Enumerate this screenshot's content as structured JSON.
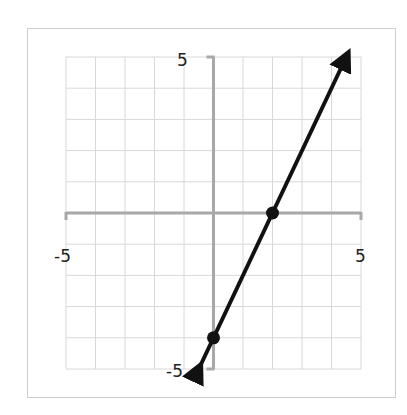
{
  "chart_data": {
    "type": "line",
    "title": "",
    "xlabel": "",
    "ylabel": "",
    "xlim": [
      -5,
      5
    ],
    "ylim": [
      -5,
      5
    ],
    "grid": true,
    "grid_step": 1,
    "tick_labels": {
      "x_min": "-5",
      "x_max": "5",
      "y_min": "-5",
      "y_max": "5"
    },
    "series": [
      {
        "name": "line",
        "equation": "y = 2x - 4",
        "slope": 2,
        "intercept": -4,
        "arrows": "both",
        "color": "#111111",
        "x": [
          -0.5,
          4.5
        ],
        "y": [
          -5,
          5
        ]
      }
    ],
    "points": [
      {
        "x": 2,
        "y": 0,
        "label": "x-intercept"
      },
      {
        "x": 0,
        "y": -4,
        "label": "y-intercept"
      }
    ],
    "colors": {
      "axis": "#a8a8a8",
      "grid": "#d8d8d8",
      "line": "#111111"
    }
  }
}
